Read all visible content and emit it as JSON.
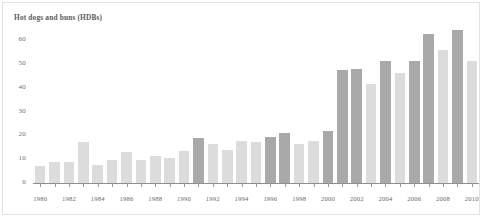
{
  "chart_data": {
    "type": "bar",
    "title": "Hot dogs and buns (HDBs)",
    "xlabel": "",
    "ylabel": "",
    "ylim": [
      0,
      65
    ],
    "yticks": [
      0,
      10,
      20,
      30,
      40,
      50,
      60
    ],
    "ytick_labels": [
      "0",
      "10",
      "20",
      "30",
      "40",
      "50",
      "60"
    ],
    "grid": false,
    "legend": null,
    "categories": [
      "1980",
      "1981",
      "1982",
      "1983",
      "1984",
      "1985",
      "1986",
      "1987",
      "1988",
      "1989",
      "1990",
      "1991",
      "1992",
      "1993",
      "1994",
      "1995",
      "1996",
      "1997",
      "1998",
      "1999",
      "2000",
      "2001",
      "2002",
      "2003",
      "2004",
      "2005",
      "2006",
      "2007",
      "2008",
      "2009",
      "2010"
    ],
    "xtick_labels": [
      "1980",
      "1982",
      "1984",
      "1986",
      "1988",
      "1990",
      "1992",
      "1994",
      "1996",
      "1998",
      "2000",
      "2002",
      "2004",
      "2006",
      "2008",
      "2010"
    ],
    "values": [
      7,
      9,
      9,
      17,
      7.5,
      9.5,
      13,
      9.5,
      11.5,
      10.5,
      13.5,
      19,
      16.5,
      14,
      17.5,
      17,
      19.5,
      21,
      16.5,
      17.5,
      22,
      47.5,
      48,
      41.5,
      51,
      46,
      51,
      62.5,
      56,
      64,
      51
    ],
    "bar_shades": [
      "light",
      "light",
      "light",
      "light",
      "light",
      "light",
      "light",
      "light",
      "light",
      "light",
      "light",
      "dark",
      "light",
      "light",
      "light",
      "light",
      "dark",
      "dark",
      "light",
      "light",
      "dark",
      "dark",
      "dark",
      "light",
      "dark",
      "light",
      "dark",
      "dark",
      "light",
      "dark",
      "light"
    ],
    "colors": {
      "bar_dark": "#a9a9a9",
      "bar_light": "#dcdcdc",
      "axis": "#8d8d8d",
      "text": "#6b6b6b",
      "title_text": "#5d5d5d",
      "frame": "#e2e2e2",
      "background": "#ffffff"
    }
  }
}
